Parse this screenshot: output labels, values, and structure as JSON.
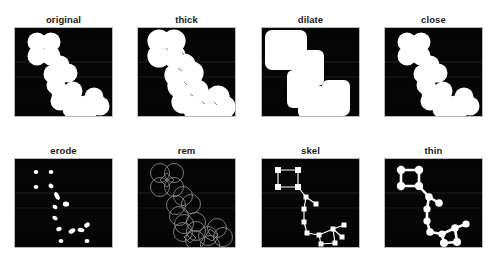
{
  "figure": {
    "title": "",
    "background_color": "#ffffff",
    "panel_background_color": "#050505",
    "panel_foreground_color": "#ffffff",
    "panel_border_color": "#b9b9b9",
    "columns": 4,
    "rows": 2,
    "panel_width": 99,
    "panel_height": 90
  },
  "panels": [
    {
      "label": "original",
      "x": 14,
      "y": 14,
      "render": "original"
    },
    {
      "label": "thick",
      "x": 137,
      "y": 14,
      "render": "thick"
    },
    {
      "label": "dilate",
      "x": 261,
      "y": 14,
      "render": "dilate"
    },
    {
      "label": "close",
      "x": 384,
      "y": 14,
      "render": "close"
    },
    {
      "label": "erode",
      "x": 14,
      "y": 145,
      "render": "erode"
    },
    {
      "label": "rem",
      "x": 137,
      "y": 145,
      "render": "rem"
    },
    {
      "label": "skel",
      "x": 261,
      "y": 145,
      "render": "skel"
    },
    {
      "label": "thin",
      "x": 384,
      "y": 145,
      "render": "thin"
    }
  ],
  "shape_data": {
    "description": "Chain of overlapping disks forming an L / S shaped blob cluster",
    "disk_radius_original": 9.5,
    "disk_radius_thick": 11.5,
    "disk_radius_close": 9.5,
    "disks": [
      [
        22,
        14
      ],
      [
        36,
        14
      ],
      [
        22,
        28
      ],
      [
        36,
        28
      ],
      [
        45,
        36
      ],
      [
        38,
        45
      ],
      [
        52,
        45
      ],
      [
        40,
        56
      ],
      [
        46,
        64
      ],
      [
        44,
        72
      ],
      [
        57,
        72
      ],
      [
        58,
        62
      ],
      [
        57,
        80
      ],
      [
        70,
        76
      ],
      [
        78,
        68
      ],
      [
        84,
        76
      ],
      [
        71,
        84
      ]
    ],
    "skeleton_nodes": [
      [
        22,
        14
      ],
      [
        36,
        14
      ],
      [
        22,
        28
      ],
      [
        36,
        28
      ],
      [
        44,
        38
      ],
      [
        52,
        44
      ],
      [
        42,
        50
      ],
      [
        42,
        62
      ],
      [
        44,
        72
      ],
      [
        56,
        74
      ],
      [
        70,
        70
      ],
      [
        58,
        82
      ],
      [
        72,
        82
      ],
      [
        82,
        70
      ]
    ],
    "skeleton_edges": [
      [
        0,
        1
      ],
      [
        0,
        2
      ],
      [
        1,
        3
      ],
      [
        2,
        3
      ],
      [
        3,
        4
      ],
      [
        4,
        5
      ],
      [
        4,
        6
      ],
      [
        6,
        7
      ],
      [
        7,
        8
      ],
      [
        8,
        9
      ],
      [
        9,
        10
      ],
      [
        8,
        11
      ],
      [
        11,
        12
      ],
      [
        12,
        10
      ],
      [
        10,
        13
      ]
    ],
    "erode_seeds": [
      [
        21,
        13
      ],
      [
        35,
        13
      ],
      [
        21,
        27
      ],
      [
        35,
        27
      ],
      [
        42,
        37
      ],
      [
        40,
        48
      ],
      [
        50,
        46
      ],
      [
        40,
        58
      ],
      [
        44,
        70
      ],
      [
        56,
        72
      ],
      [
        66,
        71
      ],
      [
        72,
        66
      ],
      [
        57,
        82
      ],
      [
        73,
        82
      ]
    ]
  }
}
